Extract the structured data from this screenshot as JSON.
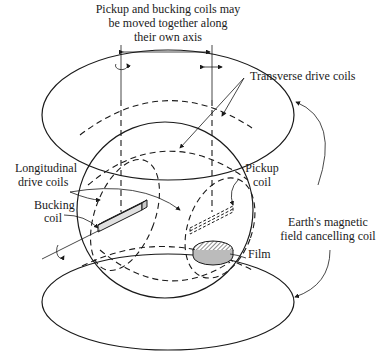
{
  "diagram": {
    "labels": {
      "motion_line1": "Pickup and bucking coils may",
      "motion_line2": "be moved together along",
      "motion_line3": "their own axis",
      "transverse": "Transverse drive coils",
      "longitudinal_line1": "Longitudinal",
      "longitudinal_line2": "drive coils",
      "bucking_line1": "Bucking",
      "bucking_line2": "coil",
      "pickup_line1": "Pickup",
      "pickup_line2": "coil",
      "earth_line1": "Earth's magnetic",
      "earth_line2": "field cancelling coil",
      "film": "Film"
    },
    "icons": [
      "rotation-arrow-icon",
      "double-arrow-icon"
    ],
    "colors": {
      "ink": "#1a1a1a",
      "background": "#ffffff",
      "rod_fill": "#e0e0e0"
    }
  }
}
